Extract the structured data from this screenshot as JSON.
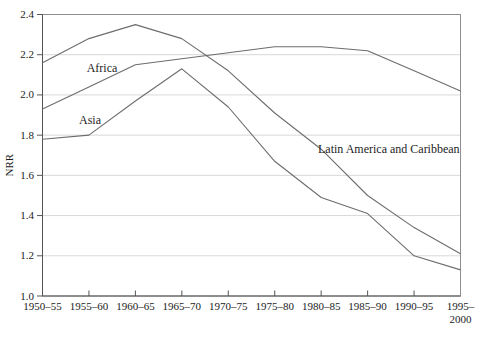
{
  "figure": {
    "kind": "statistical line chart",
    "title": ""
  },
  "chart_data": {
    "type": "line",
    "title": "",
    "xlabel": "",
    "ylabel": "NRR",
    "ylim": [
      1.0,
      2.4
    ],
    "ytick_step": 0.2,
    "ytick_labels": [
      "1.0",
      "1.2",
      "1.4",
      "1.6",
      "1.8",
      "2.0",
      "2.2",
      "2.4"
    ],
    "grid": "horizontal",
    "legend": "inline-labels",
    "categories": [
      "1950–55",
      "1955–60",
      "1960–65",
      "1965–70",
      "1970–75",
      "1975–80",
      "1980–85",
      "1985–90",
      "1990–95",
      "1995–2000"
    ],
    "x_last_label_wrap": [
      "1995–",
      "2000"
    ],
    "series": [
      {
        "name": "Africa",
        "values": [
          1.93,
          2.04,
          2.15,
          2.18,
          2.21,
          2.24,
          2.24,
          2.22,
          2.12,
          2.02
        ],
        "label_pos": {
          "x": 102,
          "y": 72,
          "anchor": "middle"
        }
      },
      {
        "name": "Asia",
        "values": [
          1.78,
          1.8,
          1.97,
          2.13,
          1.94,
          1.67,
          1.49,
          1.41,
          1.2,
          1.13
        ],
        "label_pos": {
          "x": 90,
          "y": 124,
          "anchor": "middle"
        }
      },
      {
        "name": "Latin America and Caribbean",
        "values": [
          2.16,
          2.28,
          2.35,
          2.28,
          2.12,
          1.91,
          1.73,
          1.5,
          1.34,
          1.21
        ],
        "label_pos": {
          "x": 318,
          "y": 153,
          "anchor": "start"
        }
      }
    ],
    "colors": {
      "line": "#6d6d6d",
      "grid": "#d9d9d9",
      "frame": "#8f8f8f",
      "axis": "#555555",
      "text": "#1c1c1c",
      "background": "#ffffff"
    }
  },
  "layout": {
    "width": 483,
    "height": 337,
    "plot": {
      "left": 42.5,
      "right": 460.5,
      "top": 14.5,
      "bottom": 296
    },
    "font_px": {
      "ticks": 11,
      "series_labels": 12,
      "ylabel": 11
    }
  }
}
